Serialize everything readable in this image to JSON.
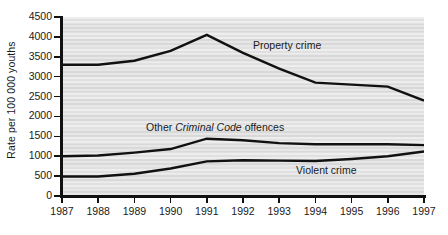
{
  "chart_data": {
    "type": "line",
    "title": "",
    "xlabel": "",
    "ylabel": "Rate per 100 000 youths",
    "categories": [
      "1987",
      "1988",
      "1989",
      "1990",
      "1991",
      "1992",
      "1993",
      "1994",
      "1995",
      "1996",
      "1997"
    ],
    "ylim": [
      0,
      4500
    ],
    "yticks": [
      0,
      500,
      1000,
      1500,
      2000,
      2500,
      3000,
      3500,
      4000,
      4500
    ],
    "ytick_labels": [
      "0",
      "500",
      "1000",
      "1500",
      "2000",
      "2500",
      "3000",
      "3500",
      "4000",
      "4500"
    ],
    "grid": false,
    "legend_position": "inline-annotations",
    "plot_background": "#e2e2e2",
    "line_color": "#111111",
    "series": [
      {
        "name": "Property crime",
        "label_text": "Property crime",
        "label_italic_part": "",
        "values": [
          3300,
          3300,
          3400,
          3650,
          4050,
          3600,
          3200,
          2850,
          2800,
          2750,
          2400
        ]
      },
      {
        "name": "Other Criminal Code offences",
        "label_text": "Other Criminal Code offences",
        "label_prefix": "Other ",
        "label_italic_part": "Criminal Code",
        "label_suffix": " offences",
        "values": [
          1000,
          1020,
          1090,
          1180,
          1440,
          1400,
          1330,
          1300,
          1300,
          1300,
          1280
        ]
      },
      {
        "name": "Violent crime",
        "label_text": "Violent crime",
        "label_italic_part": "",
        "values": [
          490,
          490,
          560,
          690,
          870,
          900,
          890,
          880,
          930,
          1000,
          1120
        ]
      }
    ],
    "annotations": [
      {
        "text": "Property crime",
        "x_px": 253,
        "y_px": 40
      },
      {
        "text": "Other Criminal Code offences",
        "x_px": 146,
        "y_px": 122
      },
      {
        "text": "Violent crime",
        "x_px": 296,
        "y_px": 165
      }
    ]
  }
}
